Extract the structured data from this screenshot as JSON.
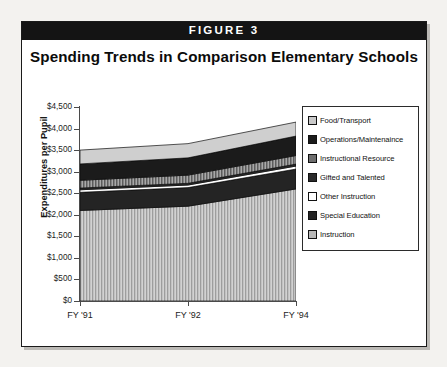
{
  "figure": {
    "bar_label": "FIGURE 3",
    "title": "Spending Trends in Comparison Elementary Schools"
  },
  "chart_data": {
    "type": "area",
    "title": "Spending Trends in Comparison Elementary Schools",
    "xlabel": "",
    "ylabel": "Expenditures per Pupil",
    "categories": [
      "FY '91",
      "FY '92",
      "FY '94"
    ],
    "x": [
      "FY '91",
      "FY '92",
      "FY '94"
    ],
    "ylim": [
      0,
      4500
    ],
    "ytick_labels": [
      "$0",
      "$500",
      "$1,000",
      "$1,500",
      "$2,000",
      "$2,500",
      "$3,000",
      "$3,500",
      "$4,000",
      "$4,500"
    ],
    "ytick_values": [
      0,
      500,
      1000,
      1500,
      2000,
      2500,
      3000,
      3500,
      4000,
      4500
    ],
    "xtick_labels": [
      "FY '91",
      "FY '92",
      "FY '94"
    ],
    "grid": false,
    "legend_position": "right",
    "stacked": true,
    "stack_order_bottom_to_top": [
      "Instruction",
      "Special Education",
      "Other Instruction",
      "Gifted and Talented",
      "Instructional Resource",
      "Operations/Maintenaince",
      "Food/Transport"
    ],
    "series": [
      {
        "name": "Instruction",
        "color": "#b9b9b9",
        "pattern": "vertical-hatch",
        "values": [
          2100,
          2200,
          2600
        ]
      },
      {
        "name": "Special Education",
        "color": "#242424",
        "pattern": "solid-dark",
        "values": [
          420,
          430,
          460
        ]
      },
      {
        "name": "Other Instruction",
        "color": "#ffffff",
        "pattern": "white",
        "values": [
          60,
          60,
          70
        ]
      },
      {
        "name": "Gifted and Talented",
        "color": "#2a2a2a",
        "pattern": "solid-dark",
        "values": [
          40,
          40,
          45
        ]
      },
      {
        "name": "Instructional Resource",
        "color": "#6e6e6e",
        "pattern": "medium-hatch",
        "values": [
          180,
          190,
          200
        ]
      },
      {
        "name": "Operations/Maintenaince",
        "color": "#1b1b1b",
        "pattern": "solid-black",
        "values": [
          380,
          400,
          450
        ]
      },
      {
        "name": "Food/Transport",
        "color": "#c9c9c9",
        "pattern": "light-gray",
        "values": [
          320,
          330,
          325
        ]
      }
    ],
    "totals": [
      3500,
      3650,
      4150
    ]
  },
  "legend": {
    "items": [
      {
        "label": "Food/Transport",
        "swatch": "food-transport-swatch"
      },
      {
        "label": "Operations/Maintenaince",
        "swatch": "operations-maintenance-swatch"
      },
      {
        "label": "Instructional Resource",
        "swatch": "instructional-resource-swatch"
      },
      {
        "label": "Gifted and Talented",
        "swatch": "gifted-talented-swatch"
      },
      {
        "label": "Other Instruction",
        "swatch": "other-instruction-swatch"
      },
      {
        "label": "Special Education",
        "swatch": "special-education-swatch"
      },
      {
        "label": "Instruction",
        "swatch": "instruction-swatch"
      }
    ]
  },
  "axes": {
    "y_axis_title": "Expenditures per Pupil"
  }
}
